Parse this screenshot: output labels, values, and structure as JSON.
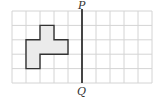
{
  "diagram": {
    "grid": {
      "columns": 10,
      "rows": 5,
      "origin_x": 12,
      "origin_y": 11,
      "cell_w": 14,
      "cell_h": 14.4,
      "line_color": "#d4d4d4"
    },
    "shape": {
      "cells": [
        [
          2,
          1
        ],
        [
          1,
          2
        ],
        [
          2,
          2
        ],
        [
          3,
          2
        ],
        [
          1,
          3
        ]
      ],
      "outline": [
        [
          2,
          1
        ],
        [
          3,
          1
        ],
        [
          3,
          2
        ],
        [
          4,
          2
        ],
        [
          4,
          3
        ],
        [
          2,
          3
        ],
        [
          2,
          4
        ],
        [
          1,
          4
        ],
        [
          1,
          2
        ],
        [
          2,
          2
        ],
        [
          2,
          1
        ]
      ],
      "fill": "#ebebeb",
      "stroke": "#333333"
    },
    "mirror_line": {
      "grid_x": 5,
      "top_label": "P",
      "bottom_label": "Q",
      "color": "#333333"
    }
  }
}
